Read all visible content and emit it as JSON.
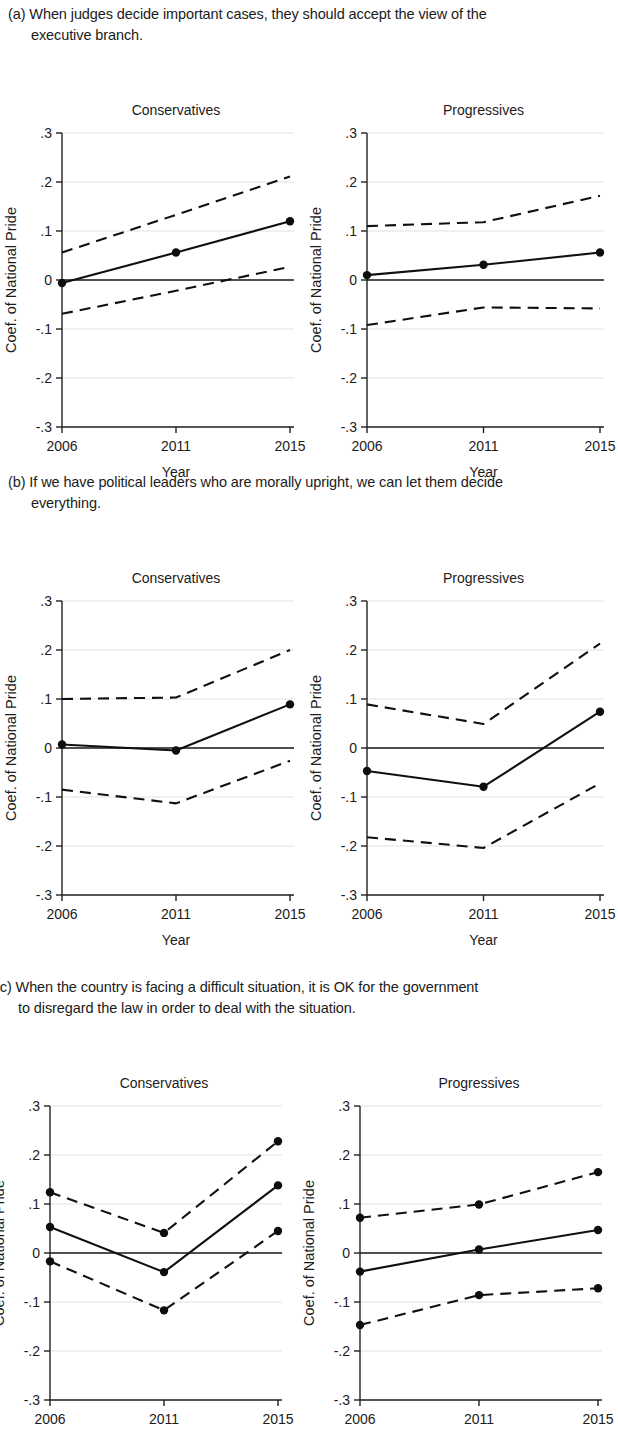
{
  "figure": {
    "y_axis_label": "Coef. of National Pride",
    "x_axis_label": "Year",
    "x_categories": [
      "2006",
      "2011",
      "2015"
    ],
    "y_ticks": [
      "-.3",
      "-.2",
      "-.1",
      "0",
      ".1",
      ".2",
      ".3"
    ],
    "group_labels": [
      "Conservatives",
      "Progressives"
    ]
  },
  "panels": [
    {
      "id": "a",
      "label": "(a)",
      "caption_line1": "When judges decide important cases, they should accept the view of the",
      "caption_line2": "executive branch."
    },
    {
      "id": "b",
      "label": "(b)",
      "caption_line1": "If we have political leaders who are morally upright, we can let them decide",
      "caption_line2": "everything."
    },
    {
      "id": "c",
      "label": "(c)",
      "caption_line1": "When the country is facing a difficult situation, it is OK for the government",
      "caption_line2": "to disregard the law in order to deal with the situation."
    }
  ],
  "chart_data": [
    {
      "type": "line",
      "title": "Conservatives",
      "panel": "a",
      "xlabel": "Year",
      "ylabel": "Coef. of National Pride",
      "x": [
        2006,
        2011,
        2015
      ],
      "xticklabels": [
        "2006",
        "2011",
        "2015"
      ],
      "ylim": [
        -0.3,
        0.3
      ],
      "yticks": [
        -0.3,
        -0.2,
        -0.1,
        0,
        0.1,
        0.2,
        0.3
      ],
      "yticklabels": [
        "-.3",
        "-.2",
        "-.1",
        "0",
        ".1",
        ".2",
        ".3"
      ],
      "grid": true,
      "legend": "none",
      "markers_on_ci": false,
      "series": [
        {
          "name": "Coefficient",
          "style": "solid",
          "values": [
            -0.006,
            0.056,
            0.12
          ]
        },
        {
          "name": "Upper 95% CI",
          "style": "dashed",
          "values": [
            0.056,
            0.133,
            0.211
          ]
        },
        {
          "name": "Lower 95% CI",
          "style": "dashed",
          "values": [
            -0.069,
            -0.022,
            0.027
          ]
        }
      ]
    },
    {
      "type": "line",
      "title": "Progressives",
      "panel": "a",
      "xlabel": "Year",
      "ylabel": "Coef. of National Pride",
      "x": [
        2006,
        2011,
        2015
      ],
      "xticklabels": [
        "2006",
        "2011",
        "2015"
      ],
      "ylim": [
        -0.3,
        0.3
      ],
      "yticks": [
        -0.3,
        -0.2,
        -0.1,
        0,
        0.1,
        0.2,
        0.3
      ],
      "yticklabels": [
        "-.3",
        "-.2",
        "-.1",
        "0",
        ".1",
        ".2",
        ".3"
      ],
      "grid": true,
      "legend": "none",
      "markers_on_ci": false,
      "series": [
        {
          "name": "Coefficient",
          "style": "solid",
          "values": [
            0.01,
            0.031,
            0.056
          ]
        },
        {
          "name": "Upper 95% CI",
          "style": "dashed",
          "values": [
            0.11,
            0.118,
            0.172
          ]
        },
        {
          "name": "Lower 95% CI",
          "style": "dashed",
          "values": [
            -0.092,
            -0.056,
            -0.058
          ]
        }
      ]
    },
    {
      "type": "line",
      "title": "Conservatives",
      "panel": "b",
      "xlabel": "Year",
      "ylabel": "Coef. of National Pride",
      "x": [
        2006,
        2011,
        2015
      ],
      "xticklabels": [
        "2006",
        "2011",
        "2015"
      ],
      "ylim": [
        -0.3,
        0.3
      ],
      "yticks": [
        -0.3,
        -0.2,
        -0.1,
        0,
        0.1,
        0.2,
        0.3
      ],
      "yticklabels": [
        "-.3",
        "-.2",
        "-.1",
        "0",
        ".1",
        ".2",
        ".3"
      ],
      "grid": true,
      "legend": "none",
      "markers_on_ci": false,
      "series": [
        {
          "name": "Coefficient",
          "style": "solid",
          "values": [
            0.007,
            -0.005,
            0.089
          ]
        },
        {
          "name": "Upper 95% CI",
          "style": "dashed",
          "values": [
            0.1,
            0.103,
            0.2
          ]
        },
        {
          "name": "Lower 95% CI",
          "style": "dashed",
          "values": [
            -0.085,
            -0.113,
            -0.026
          ]
        }
      ]
    },
    {
      "type": "line",
      "title": "Progressives",
      "panel": "b",
      "xlabel": "Year",
      "ylabel": "Coef. of National Pride",
      "x": [
        2006,
        2011,
        2015
      ],
      "xticklabels": [
        "2006",
        "2011",
        "2015"
      ],
      "ylim": [
        -0.3,
        0.3
      ],
      "yticks": [
        -0.3,
        -0.2,
        -0.1,
        0,
        0.1,
        0.2,
        0.3
      ],
      "yticklabels": [
        "-.3",
        "-.2",
        "-.1",
        "0",
        ".1",
        ".2",
        ".3"
      ],
      "grid": true,
      "legend": "none",
      "markers_on_ci": false,
      "series": [
        {
          "name": "Coefficient",
          "style": "solid",
          "values": [
            -0.047,
            -0.079,
            0.074
          ]
        },
        {
          "name": "Upper 95% CI",
          "style": "dashed",
          "values": [
            0.089,
            0.049,
            0.213
          ]
        },
        {
          "name": "Lower 95% CI",
          "style": "dashed",
          "values": [
            -0.182,
            -0.204,
            -0.072
          ]
        }
      ]
    },
    {
      "type": "line",
      "title": "Conservatives",
      "panel": "c",
      "xlabel": "Year",
      "ylabel": "Coef. of National Pride",
      "x": [
        2006,
        2011,
        2015
      ],
      "xticklabels": [
        "2006",
        "2011",
        "2015"
      ],
      "ylim": [
        -0.3,
        0.3
      ],
      "yticks": [
        -0.3,
        -0.2,
        -0.1,
        0,
        0.1,
        0.2,
        0.3
      ],
      "yticklabels": [
        "-.3",
        "-.2",
        "-.1",
        "0",
        ".1",
        ".2",
        ".3"
      ],
      "grid": true,
      "legend": "none",
      "markers_on_ci": true,
      "series": [
        {
          "name": "Coefficient",
          "style": "solid",
          "values": [
            0.053,
            -0.039,
            0.138
          ]
        },
        {
          "name": "Upper 95% CI",
          "style": "dashed",
          "values": [
            0.124,
            0.041,
            0.228
          ]
        },
        {
          "name": "Lower 95% CI",
          "style": "dashed",
          "values": [
            -0.017,
            -0.117,
            0.045
          ]
        }
      ]
    },
    {
      "type": "line",
      "title": "Progressives",
      "panel": "c",
      "xlabel": "Year",
      "ylabel": "Coef. of National Pride",
      "x": [
        2006,
        2011,
        2015
      ],
      "xticklabels": [
        "2006",
        "2011",
        "2015"
      ],
      "ylim": [
        -0.3,
        0.3
      ],
      "yticks": [
        -0.3,
        -0.2,
        -0.1,
        0,
        0.1,
        0.2,
        0.3
      ],
      "yticklabels": [
        "-.3",
        "-.2",
        "-.1",
        "0",
        ".1",
        ".2",
        ".3"
      ],
      "grid": true,
      "legend": "none",
      "markers_on_ci": true,
      "series": [
        {
          "name": "Coefficient",
          "style": "solid",
          "values": [
            -0.038,
            0.007,
            0.047
          ]
        },
        {
          "name": "Upper 95% CI",
          "style": "dashed",
          "values": [
            0.072,
            0.099,
            0.165
          ]
        },
        {
          "name": "Lower 95% CI",
          "style": "dashed",
          "values": [
            -0.147,
            -0.086,
            -0.072
          ]
        }
      ]
    }
  ]
}
